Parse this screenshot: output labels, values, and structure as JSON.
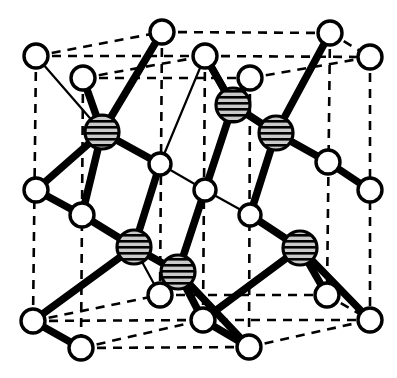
{
  "figure": {
    "kind": "crystal-structure-diagram",
    "canvas": {
      "width": 397,
      "height": 378
    },
    "background_color": "#ffffff",
    "line_color": "#000000",
    "open_atom_fill": "#ffffff",
    "shaded_atom_fill": "#b8b8b8",
    "shaded_atom_stripe": "#000000",
    "legend": {
      "open_atom_label": "open circle atom",
      "shaded_atom_label": "hatched circle atom"
    },
    "counts": {
      "open_atoms": 20,
      "shaded_atoms": 6,
      "dashed_cell_edges": 12
    }
  },
  "atoms": {
    "open": [
      {
        "name": "open-atom-top-back-left",
        "x": 36,
        "y": 56,
        "r": 12
      },
      {
        "name": "open-atom-top-mid-left",
        "x": 83,
        "y": 78,
        "r": 12
      },
      {
        "name": "open-atom-top-back-mid",
        "x": 162,
        "y": 32,
        "r": 12
      },
      {
        "name": "open-atom-top-front-mid",
        "x": 205,
        "y": 56,
        "r": 12
      },
      {
        "name": "open-atom-top-mid-right",
        "x": 250,
        "y": 78,
        "r": 12
      },
      {
        "name": "open-atom-top-back-right",
        "x": 330,
        "y": 33,
        "r": 12
      },
      {
        "name": "open-atom-top-front-right",
        "x": 370,
        "y": 57,
        "r": 12
      },
      {
        "name": "open-atom-mid-left-upper",
        "x": 160,
        "y": 164,
        "r": 11
      },
      {
        "name": "open-atom-center",
        "x": 205,
        "y": 190,
        "r": 11
      },
      {
        "name": "open-atom-mid-right-lower",
        "x": 250,
        "y": 215,
        "r": 11
      },
      {
        "name": "open-atom-mid-right-upper",
        "x": 328,
        "y": 162,
        "r": 12
      },
      {
        "name": "open-atom-right-edge-mid",
        "x": 370,
        "y": 190,
        "r": 12
      },
      {
        "name": "open-atom-left-edge-mid",
        "x": 36,
        "y": 190,
        "r": 12
      },
      {
        "name": "open-atom-left-inner-mid",
        "x": 82,
        "y": 215,
        "r": 12
      },
      {
        "name": "open-atom-bottom-left",
        "x": 33,
        "y": 321,
        "r": 12
      },
      {
        "name": "open-atom-bottom-front-left",
        "x": 81,
        "y": 348,
        "r": 12
      },
      {
        "name": "open-atom-bottom-mid",
        "x": 160,
        "y": 295,
        "r": 12
      },
      {
        "name": "open-atom-bottom-center",
        "x": 203,
        "y": 320,
        "r": 12
      },
      {
        "name": "open-atom-bottom-front-mid",
        "x": 249,
        "y": 347,
        "r": 12
      },
      {
        "name": "open-atom-bottom-mid-right",
        "x": 327,
        "y": 295,
        "r": 12
      },
      {
        "name": "open-atom-bottom-right",
        "x": 370,
        "y": 320,
        "r": 12
      }
    ],
    "shaded": [
      {
        "name": "shaded-atom-upper-left",
        "x": 102,
        "y": 132,
        "r": 17
      },
      {
        "name": "shaded-atom-upper-mid",
        "x": 233,
        "y": 105,
        "r": 17
      },
      {
        "name": "shaded-atom-upper-right",
        "x": 276,
        "y": 133,
        "r": 17
      },
      {
        "name": "shaded-atom-lower-left",
        "x": 134,
        "y": 247,
        "r": 17
      },
      {
        "name": "shaded-atom-lower-mid",
        "x": 178,
        "y": 272,
        "r": 17
      },
      {
        "name": "shaded-atom-lower-right",
        "x": 300,
        "y": 248,
        "r": 17
      }
    ]
  },
  "cell_edges_dashed": [
    {
      "name": "cell-edge-top-back-left",
      "x1": 36,
      "y1": 56,
      "x2": 162,
      "y2": 32
    },
    {
      "name": "cell-edge-top-back-right",
      "x1": 162,
      "y1": 32,
      "x2": 330,
      "y2": 33
    },
    {
      "name": "cell-edge-top-mid-left",
      "x1": 83,
      "y1": 78,
      "x2": 205,
      "y2": 56
    },
    {
      "name": "cell-edge-top-mid-right",
      "x1": 205,
      "y1": 56,
      "x2": 370,
      "y2": 57
    },
    {
      "name": "cell-edge-top-diag-left",
      "x1": 36,
      "y1": 56,
      "x2": 205,
      "y2": 56
    },
    {
      "name": "cell-edge-top-diag-right",
      "x1": 83,
      "y1": 78,
      "x2": 250,
      "y2": 78
    },
    {
      "name": "cell-edge-top-far-right",
      "x1": 330,
      "y1": 33,
      "x2": 370,
      "y2": 57
    },
    {
      "name": "cell-edge-top-inner-right",
      "x1": 250,
      "y1": 78,
      "x2": 370,
      "y2": 57
    },
    {
      "name": "cell-edge-vert-left",
      "x1": 36,
      "y1": 56,
      "x2": 33,
      "y2": 321
    },
    {
      "name": "cell-edge-vert-left-inner",
      "x1": 83,
      "y1": 78,
      "x2": 81,
      "y2": 348
    },
    {
      "name": "cell-edge-vert-mid-back",
      "x1": 162,
      "y1": 32,
      "x2": 160,
      "y2": 295
    },
    {
      "name": "cell-edge-vert-mid-front",
      "x1": 205,
      "y1": 56,
      "x2": 203,
      "y2": 320
    },
    {
      "name": "cell-edge-vert-mid-right",
      "x1": 250,
      "y1": 78,
      "x2": 249,
      "y2": 347
    },
    {
      "name": "cell-edge-vert-right-back",
      "x1": 330,
      "y1": 33,
      "x2": 327,
      "y2": 295
    },
    {
      "name": "cell-edge-vert-right",
      "x1": 370,
      "y1": 57,
      "x2": 370,
      "y2": 320
    },
    {
      "name": "cell-edge-bot-back-left",
      "x1": 33,
      "y1": 321,
      "x2": 160,
      "y2": 295
    },
    {
      "name": "cell-edge-bot-back-right",
      "x1": 160,
      "y1": 295,
      "x2": 327,
      "y2": 295
    },
    {
      "name": "cell-edge-bot-mid-left",
      "x1": 81,
      "y1": 348,
      "x2": 203,
      "y2": 320
    },
    {
      "name": "cell-edge-bot-mid-right",
      "x1": 203,
      "y1": 320,
      "x2": 370,
      "y2": 320
    },
    {
      "name": "cell-edge-bot-diag-left",
      "x1": 33,
      "y1": 321,
      "x2": 203,
      "y2": 320
    },
    {
      "name": "cell-edge-bot-diag-right",
      "x1": 81,
      "y1": 348,
      "x2": 249,
      "y2": 347
    },
    {
      "name": "cell-edge-bot-far-right",
      "x1": 327,
      "y1": 295,
      "x2": 370,
      "y2": 320
    },
    {
      "name": "cell-edge-bot-inner-right",
      "x1": 249,
      "y1": 347,
      "x2": 370,
      "y2": 320
    }
  ],
  "bonds_thick": [
    {
      "name": "bond-ul-to-topmidleft",
      "x1": 102,
      "y1": 132,
      "x2": 83,
      "y2": 78
    },
    {
      "name": "bond-ul-to-center-open",
      "x1": 102,
      "y1": 132,
      "x2": 160,
      "y2": 164
    },
    {
      "name": "bond-ul-to-leftinner",
      "x1": 102,
      "y1": 132,
      "x2": 82,
      "y2": 215
    },
    {
      "name": "bond-um-to-topfrontmid",
      "x1": 233,
      "y1": 105,
      "x2": 205,
      "y2": 56
    },
    {
      "name": "bond-um-to-topmidright",
      "x1": 233,
      "y1": 105,
      "x2": 250,
      "y2": 78
    },
    {
      "name": "bond-um-to-center",
      "x1": 233,
      "y1": 105,
      "x2": 205,
      "y2": 190
    },
    {
      "name": "bond-um-to-ur",
      "x1": 233,
      "y1": 105,
      "x2": 276,
      "y2": 133
    },
    {
      "name": "bond-ur-to-topbackright",
      "x1": 276,
      "y1": 133,
      "x2": 330,
      "y2": 33
    },
    {
      "name": "bond-ur-to-midrightupper",
      "x1": 276,
      "y1": 133,
      "x2": 328,
      "y2": 162
    },
    {
      "name": "bond-ur-to-midrightlower",
      "x1": 276,
      "y1": 133,
      "x2": 250,
      "y2": 215
    },
    {
      "name": "bond-ll-to-leftinner",
      "x1": 134,
      "y1": 247,
      "x2": 82,
      "y2": 215
    },
    {
      "name": "bond-ll-to-midleftupper",
      "x1": 134,
      "y1": 247,
      "x2": 160,
      "y2": 164
    },
    {
      "name": "bond-ll-to-bottomleft",
      "x1": 134,
      "y1": 247,
      "x2": 33,
      "y2": 321
    },
    {
      "name": "bond-ll-to-lm",
      "x1": 134,
      "y1": 247,
      "x2": 178,
      "y2": 272
    },
    {
      "name": "bond-lm-to-center",
      "x1": 178,
      "y1": 272,
      "x2": 205,
      "y2": 190
    },
    {
      "name": "bond-lm-to-bottomcenter",
      "x1": 178,
      "y1": 272,
      "x2": 203,
      "y2": 320
    },
    {
      "name": "bond-lm-to-bottomfrontmid",
      "x1": 178,
      "y1": 272,
      "x2": 249,
      "y2": 347
    },
    {
      "name": "bond-lr-to-midrightlower",
      "x1": 300,
      "y1": 248,
      "x2": 250,
      "y2": 215
    },
    {
      "name": "bond-lr-to-bottommidright",
      "x1": 300,
      "y1": 248,
      "x2": 327,
      "y2": 295
    },
    {
      "name": "bond-lr-to-bottomright",
      "x1": 300,
      "y1": 248,
      "x2": 370,
      "y2": 320
    },
    {
      "name": "bond-lr-to-bottomcenter",
      "x1": 300,
      "y1": 248,
      "x2": 203,
      "y2": 320
    },
    {
      "name": "bond-ul-to-topbackmid",
      "x1": 102,
      "y1": 132,
      "x2": 162,
      "y2": 32
    },
    {
      "name": "bond-topfrontmid-down",
      "x1": 205,
      "y1": 56,
      "x2": 233,
      "y2": 105
    },
    {
      "name": "bond-leftedge-to-leftinner",
      "x1": 36,
      "y1": 190,
      "x2": 82,
      "y2": 215
    },
    {
      "name": "bond-ul-to-leftedge",
      "x1": 102,
      "y1": 132,
      "x2": 36,
      "y2": 190
    },
    {
      "name": "bond-midrightupper-right",
      "x1": 328,
      "y1": 162,
      "x2": 370,
      "y2": 190
    },
    {
      "name": "bond-bottomcenter-front",
      "x1": 203,
      "y1": 320,
      "x2": 249,
      "y2": 347
    },
    {
      "name": "bond-bottomleft-front",
      "x1": 33,
      "y1": 321,
      "x2": 81,
      "y2": 348
    }
  ],
  "bonds_thin": [
    {
      "name": "bondthin-topbackleft-to-ul",
      "x1": 36,
      "y1": 56,
      "x2": 102,
      "y2": 132
    },
    {
      "name": "bondthin-midleftupper-center",
      "x1": 160,
      "y1": 164,
      "x2": 205,
      "y2": 190
    },
    {
      "name": "bondthin-center-midrightlower",
      "x1": 205,
      "y1": 190,
      "x2": 250,
      "y2": 215
    },
    {
      "name": "bondthin-topfrontmid-midleft",
      "x1": 205,
      "y1": 56,
      "x2": 160,
      "y2": 164
    },
    {
      "name": "bondthin-um-center",
      "x1": 233,
      "y1": 105,
      "x2": 205,
      "y2": 190
    },
    {
      "name": "bondthin-lm-bottomcenter",
      "x1": 178,
      "y1": 272,
      "x2": 160,
      "y2": 295
    },
    {
      "name": "bondthin-lr-bottommidright",
      "x1": 300,
      "y1": 248,
      "x2": 327,
      "y2": 295
    },
    {
      "name": "bondthin-ll-bottommid",
      "x1": 134,
      "y1": 247,
      "x2": 160,
      "y2": 295
    }
  ]
}
